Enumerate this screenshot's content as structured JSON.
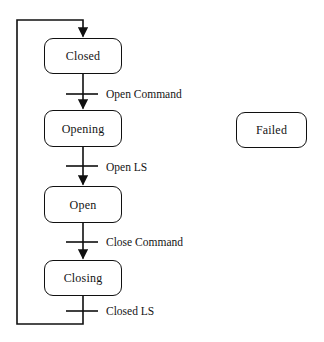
{
  "diagram": {
    "kind": "state-machine-diagram",
    "title": "",
    "canvas": {
      "width": 324,
      "height": 342
    },
    "style": {
      "background_color": "#ffffff",
      "line_color": "#101010",
      "text_color": "#141414",
      "node_fill": "#ffffff",
      "corner_radius": 9
    },
    "states": [
      {
        "id": "closed",
        "label": "Closed",
        "x": 44,
        "y": 38,
        "width": 78,
        "height": 36
      },
      {
        "id": "opening",
        "label": "Opening",
        "x": 44,
        "y": 110,
        "width": 78,
        "height": 37
      },
      {
        "id": "open",
        "label": "Open",
        "x": 44,
        "y": 186,
        "width": 78,
        "height": 37
      },
      {
        "id": "closing",
        "label": "Closing",
        "x": 44,
        "y": 260,
        "width": 78,
        "height": 36
      },
      {
        "id": "failed",
        "label": "Failed",
        "x": 236,
        "y": 112,
        "width": 71,
        "height": 36
      }
    ],
    "transitions": [
      {
        "id": "t-open-command",
        "from": "closed",
        "to": "opening",
        "label": "Open Command",
        "label_x": 106,
        "label_y": 89
      },
      {
        "id": "t-open-ls",
        "from": "opening",
        "to": "open",
        "label": "Open LS",
        "label_x": 106,
        "label_y": 162
      },
      {
        "id": "t-close-command",
        "from": "open",
        "to": "closing",
        "label": "Close Command",
        "label_x": 106,
        "label_y": 237
      },
      {
        "id": "t-closed-ls",
        "from": "closing",
        "to": "closed",
        "label": "Closed LS",
        "label_x": 106,
        "label_y": 306
      }
    ]
  }
}
